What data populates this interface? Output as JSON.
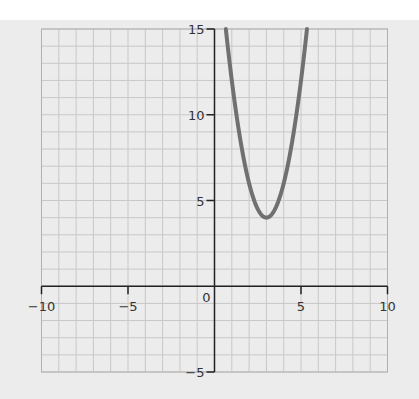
{
  "chart_data": {
    "type": "line",
    "title": "",
    "xlabel": "",
    "ylabel": "",
    "xlim": [
      -10,
      10
    ],
    "ylim": [
      -5,
      15
    ],
    "grid": true,
    "grid_step": 1,
    "x_ticks": [
      -10,
      -5,
      0,
      5,
      10
    ],
    "x_tick_labels": [
      "−10",
      "−5",
      "0",
      "5",
      "10"
    ],
    "y_ticks": [
      -5,
      5,
      10,
      15
    ],
    "y_tick_labels": [
      "−5",
      "5",
      "10",
      "15"
    ],
    "origin_label": "0",
    "series": [
      {
        "name": "parabola",
        "equation": "y = 2(x − 3)² + 4",
        "vertex": [
          3,
          4
        ],
        "color": "#707070",
        "x": [
          0.65,
          1,
          1.5,
          2,
          2.5,
          3,
          3.5,
          4,
          4.5,
          5,
          5.35
        ],
        "y": [
          15.05,
          12,
          8.5,
          6,
          4.5,
          4,
          4.5,
          6,
          8.5,
          12,
          15.05
        ]
      }
    ]
  },
  "colors": {
    "background": "#ececec",
    "grid": "#c8c8c8",
    "axis": "#222222",
    "curve": "#707070"
  }
}
